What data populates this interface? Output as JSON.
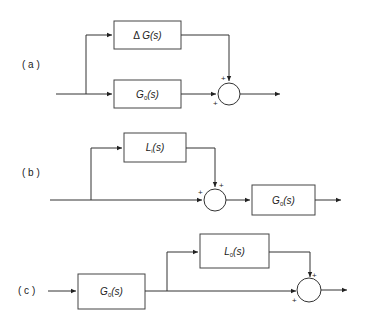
{
  "diagrams": [
    {
      "label": "( a )",
      "blocks": [
        {
          "id": "delta_g",
          "prefix": "Δ ",
          "name": "G",
          "sub": "",
          "arg": "(s)"
        },
        {
          "id": "g0",
          "prefix": "",
          "name": "G",
          "sub": "0",
          "arg": "(s)"
        }
      ],
      "summing_junction": {
        "signs": [
          "+",
          "+"
        ]
      }
    },
    {
      "label": "( b )",
      "blocks": [
        {
          "id": "l",
          "prefix": "",
          "name": "L",
          "sub": "i",
          "arg": "(s)"
        },
        {
          "id": "g0",
          "prefix": "",
          "name": "G",
          "sub": "0",
          "arg": "(s)"
        }
      ],
      "summing_junction": {
        "signs": [
          "+",
          "+"
        ]
      }
    },
    {
      "label": "( c )",
      "blocks": [
        {
          "id": "g0",
          "prefix": "",
          "name": "G",
          "sub": "0",
          "arg": "(s)"
        },
        {
          "id": "l0",
          "prefix": "",
          "name": "L",
          "sub": "0",
          "arg": "(s)"
        }
      ],
      "summing_junction": {
        "signs": [
          "+",
          "+"
        ]
      }
    }
  ]
}
